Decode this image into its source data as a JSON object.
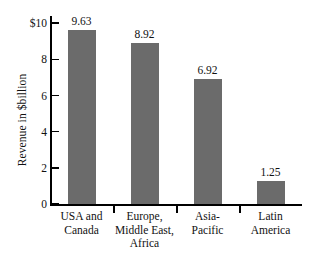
{
  "chart_data": {
    "type": "bar",
    "title": "",
    "xlabel": "",
    "ylabel": "Revenue in $billion",
    "categories": [
      "USA and Canada",
      "Europe, Middle East, Africa",
      "Asia-Pacific",
      "Latin America"
    ],
    "category_lines": [
      [
        "USA and",
        "Canada"
      ],
      [
        "Europe,",
        "Middle East,",
        "Africa"
      ],
      [
        "Asia-",
        "Pacific"
      ],
      [
        "Latin",
        "America"
      ]
    ],
    "values": [
      9.63,
      8.92,
      6.92,
      1.25
    ],
    "value_labels": [
      "9.63",
      "8.92",
      "6.92",
      "1.25"
    ],
    "ylim": [
      0,
      10.4
    ],
    "yticks": [
      0,
      2,
      4,
      6,
      8,
      10
    ],
    "ytick_labels": [
      "0",
      "2",
      "4",
      "6",
      "8",
      "$10"
    ],
    "grid": false,
    "legend": null,
    "bar_color": "#6b6b6b",
    "axis_color": "#000000",
    "background_color": "#ffffff"
  }
}
